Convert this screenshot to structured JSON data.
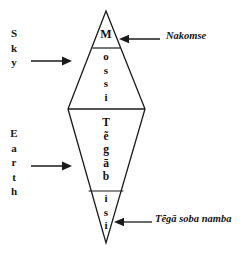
{
  "diagram": {
    "background_color": "#ffffff",
    "line_color": "#1a1a1a",
    "axis_labels": [
      {
        "id": "sky",
        "text": "Sky",
        "letters": [
          "S",
          "k",
          "y"
        ]
      },
      {
        "id": "earth",
        "text": "Earth",
        "letters": [
          "E",
          "a",
          "r",
          "t",
          "h"
        ]
      }
    ],
    "sections": [
      {
        "id": "nakomse-apex",
        "text": "M",
        "letters": [
          "M"
        ]
      },
      {
        "id": "mossi",
        "text": "ossi",
        "letters": [
          "o",
          "s",
          "s",
          "i"
        ]
      },
      {
        "id": "tegabisi",
        "text": "Tẽgābi",
        "letters": [
          "T",
          "ẽ",
          "g",
          "ā",
          "b"
        ]
      },
      {
        "id": "tega-soba",
        "text": "si",
        "letters": [
          "i",
          "s",
          "i"
        ]
      }
    ],
    "callouts": [
      {
        "id": "nakomse",
        "text": "Nakomse"
      },
      {
        "id": "tega-soba-namba",
        "text": "Tẽgā soba namba"
      }
    ],
    "arrows": [
      {
        "id": "sky-arrow",
        "direction": "right"
      },
      {
        "id": "earth-arrow",
        "direction": "right"
      },
      {
        "id": "nakomse-arrow",
        "direction": "left"
      },
      {
        "id": "tega-soba-arrow",
        "direction": "left"
      }
    ]
  }
}
